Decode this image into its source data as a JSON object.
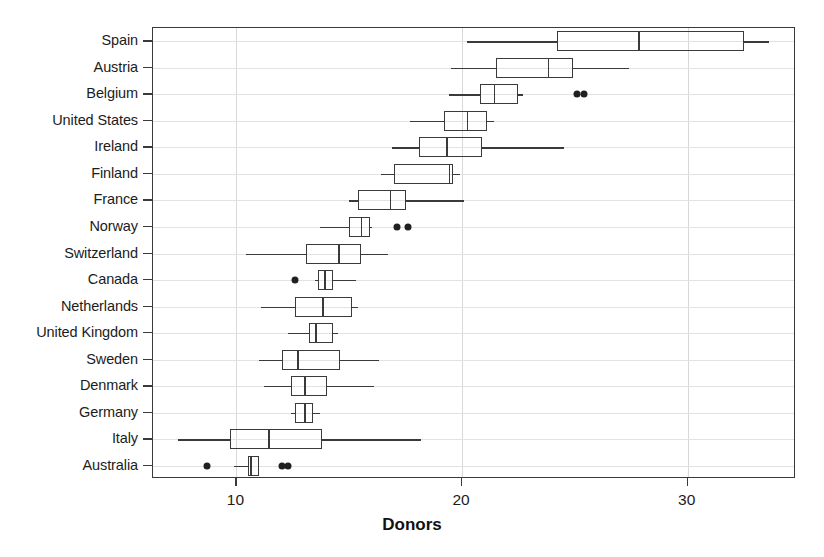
{
  "chart_data": {
    "type": "box",
    "title": "",
    "xlabel": "Donors",
    "ylabel": "",
    "xlim": [
      6.3,
      34.8
    ],
    "xticks": [
      10,
      20,
      30
    ],
    "xtick_labels": [
      "10",
      "20",
      "30"
    ],
    "grid": true,
    "legend": "none",
    "orientation": "horizontal",
    "categories": [
      "Spain",
      "Austria",
      "Belgium",
      "United States",
      "Ireland",
      "Finland",
      "France",
      "Norway",
      "Switzerland",
      "Canada",
      "Netherlands",
      "United Kingdom",
      "Sweden",
      "Denmark",
      "Germany",
      "Italy",
      "Australia"
    ],
    "boxes": [
      {
        "category": "Spain",
        "whisker_low": 20.2,
        "q1": 24.2,
        "median": 27.8,
        "q3": 32.5,
        "whisker_high": 33.6,
        "outliers": []
      },
      {
        "category": "Austria",
        "whisker_low": 19.5,
        "q1": 21.5,
        "median": 23.8,
        "q3": 24.9,
        "whisker_high": 27.4,
        "outliers": []
      },
      {
        "category": "Belgium",
        "whisker_low": 19.4,
        "q1": 20.8,
        "median": 21.4,
        "q3": 22.5,
        "whisker_high": 22.7,
        "outliers": [
          25.1,
          25.4
        ]
      },
      {
        "category": "United States",
        "whisker_low": 17.7,
        "q1": 19.2,
        "median": 20.2,
        "q3": 21.1,
        "whisker_high": 21.4,
        "outliers": []
      },
      {
        "category": "Ireland",
        "whisker_low": 16.9,
        "q1": 18.1,
        "median": 19.3,
        "q3": 20.9,
        "whisker_high": 24.5,
        "outliers": []
      },
      {
        "category": "Finland",
        "whisker_low": 16.4,
        "q1": 17.0,
        "median": 19.4,
        "q3": 19.6,
        "whisker_high": 19.9,
        "outliers": []
      },
      {
        "category": "France",
        "whisker_low": 15.0,
        "q1": 15.4,
        "median": 16.8,
        "q3": 17.5,
        "whisker_high": 20.1,
        "outliers": []
      },
      {
        "category": "Norway",
        "whisker_low": 13.7,
        "q1": 15.0,
        "median": 15.5,
        "q3": 15.9,
        "whisker_high": 16.0,
        "outliers": [
          17.1,
          17.6
        ]
      },
      {
        "category": "Switzerland",
        "whisker_low": 10.4,
        "q1": 13.1,
        "median": 14.5,
        "q3": 15.5,
        "whisker_high": 16.7,
        "outliers": []
      },
      {
        "category": "Canada",
        "whisker_low": 13.5,
        "q1": 13.6,
        "median": 13.9,
        "q3": 14.3,
        "whisker_high": 15.3,
        "outliers": [
          12.6
        ]
      },
      {
        "category": "Netherlands",
        "whisker_low": 11.1,
        "q1": 12.6,
        "median": 13.8,
        "q3": 15.1,
        "whisker_high": 15.4,
        "outliers": []
      },
      {
        "category": "United Kingdom",
        "whisker_low": 12.3,
        "q1": 13.2,
        "median": 13.5,
        "q3": 14.3,
        "whisker_high": 14.5,
        "outliers": []
      },
      {
        "category": "Sweden",
        "whisker_low": 11.0,
        "q1": 12.0,
        "median": 12.7,
        "q3": 14.6,
        "whisker_high": 16.3,
        "outliers": []
      },
      {
        "category": "Denmark",
        "whisker_low": 11.2,
        "q1": 12.4,
        "median": 13.0,
        "q3": 14.0,
        "whisker_high": 16.1,
        "outliers": []
      },
      {
        "category": "Germany",
        "whisker_low": 12.4,
        "q1": 12.6,
        "median": 13.0,
        "q3": 13.4,
        "whisker_high": 13.7,
        "outliers": []
      },
      {
        "category": "Italy",
        "whisker_low": 7.4,
        "q1": 9.7,
        "median": 11.4,
        "q3": 13.8,
        "whisker_high": 18.2,
        "outliers": []
      },
      {
        "category": "Australia",
        "whisker_low": 9.9,
        "q1": 10.5,
        "median": 10.6,
        "q3": 11.0,
        "whisker_high": 11.0,
        "outliers": [
          8.7,
          12.0,
          12.3
        ]
      }
    ]
  },
  "axis": {
    "xlabel": "Donors",
    "xtick_labels": [
      "10",
      "20",
      "30"
    ]
  },
  "colors": {
    "frame": "#3a3a3a",
    "grid": "#dcdcdc",
    "box_line": "#3a3a3a",
    "outlier": "#202020",
    "text": "#1c1c1c",
    "background": "#ffffff"
  }
}
